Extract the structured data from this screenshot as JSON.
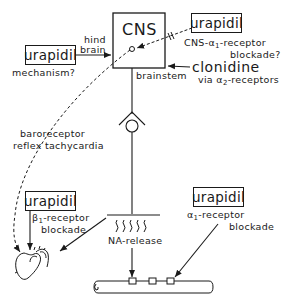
{
  "diagram": {
    "cns_box": {
      "label": "CNS"
    },
    "hindbrain_label": {
      "line1": "hind",
      "line2": "brain"
    },
    "brainstem_label": "brainstem",
    "urapidil_mechanism": {
      "drug": "urapidil",
      "caption": "mechanism?"
    },
    "urapidil_cns": {
      "drug": "urapidil",
      "caption_line1_prefix": "CNS-",
      "caption_line1_greek": "α",
      "caption_line1_sub": "1",
      "caption_line1_suffix": "-receptor",
      "caption_line2": "blockade?"
    },
    "clonidine": {
      "drug": "clonidine",
      "caption_prefix": "via ",
      "caption_greek": "α",
      "caption_sub": "2",
      "caption_suffix": "-receptors"
    },
    "baroreceptor_label": {
      "line1": "baroreceptor",
      "line2": "reflex tachycardia"
    },
    "urapidil_beta": {
      "drug": "urapidil",
      "caption_greek": "β",
      "caption_sub": "1",
      "caption_line1_suffix": "-receptor",
      "caption_line2": "blockade"
    },
    "urapidil_alpha": {
      "drug": "urapidil",
      "caption_greek": "α",
      "caption_sub": "1",
      "caption_line1_suffix": "-receptor",
      "caption_line2": "blockade"
    },
    "na_release_label": "NA-release",
    "icons": {
      "heart": "heart-icon",
      "vessel": "blood-vessel-icon",
      "ganglion": "ganglion-synapse-icon"
    },
    "colors": {
      "ink": "#1a1a1a",
      "background": "#ffffff"
    }
  }
}
